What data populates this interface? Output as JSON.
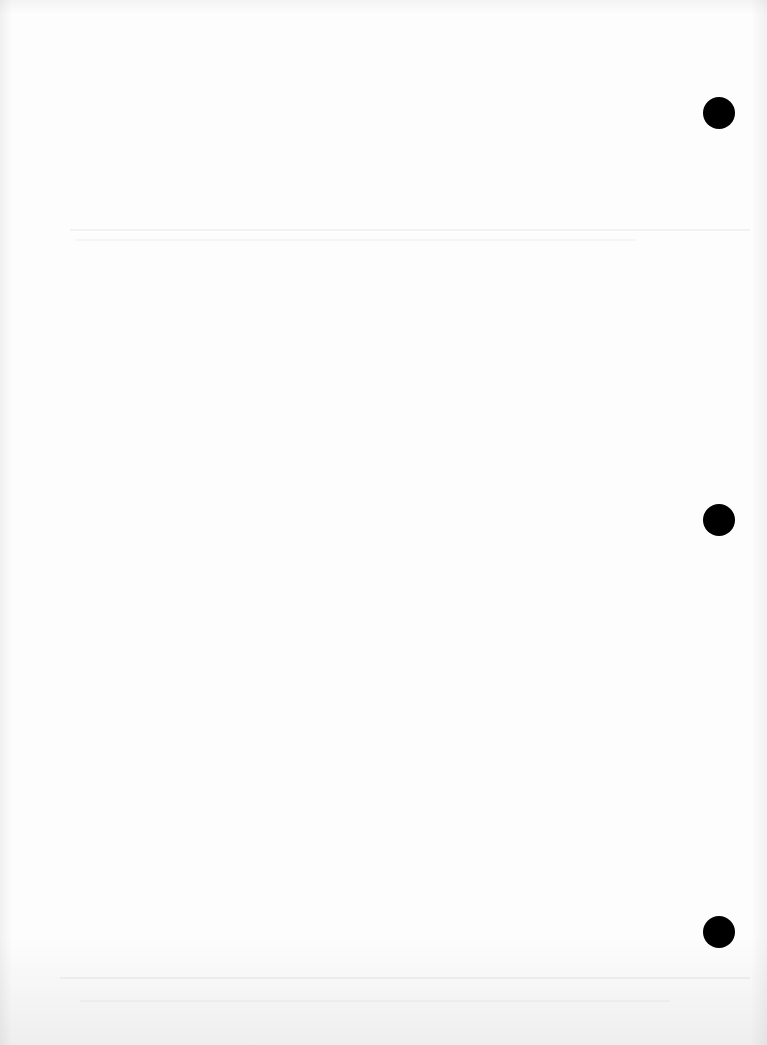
{
  "document": {
    "type": "blank scanned page",
    "text": "",
    "background_color": "#fdfdfd",
    "hole_punch_color": "#000000",
    "hole_punches": [
      {
        "x": 719,
        "y": 113
      },
      {
        "x": 719,
        "y": 520
      },
      {
        "x": 719,
        "y": 932
      }
    ]
  }
}
